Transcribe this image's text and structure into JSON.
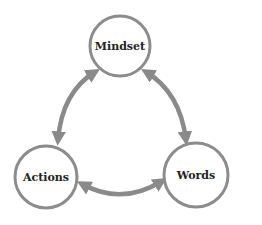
{
  "diagram": {
    "type": "cycle",
    "colors": {
      "stroke": "#8c8c8c",
      "arrow": "#8a8a8a",
      "text": "#222222",
      "background": "#ffffff"
    },
    "nodes": [
      {
        "id": "mindset",
        "label": "Mindset",
        "cx": 120,
        "cy": 46,
        "r": 30
      },
      {
        "id": "actions",
        "label": "Actions",
        "cx": 46,
        "cy": 177,
        "r": 31
      },
      {
        "id": "words",
        "label": "Words",
        "cx": 196,
        "cy": 175,
        "r": 32
      }
    ],
    "edges": [
      {
        "from": "actions",
        "to": "mindset",
        "bidirectional": true
      },
      {
        "from": "mindset",
        "to": "words",
        "bidirectional": true
      },
      {
        "from": "actions",
        "to": "words",
        "bidirectional": true
      }
    ]
  }
}
